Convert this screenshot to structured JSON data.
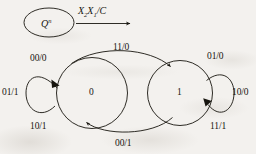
{
  "diagram": {
    "title_semantic": "mealy-state-transition-diagram",
    "legend": {
      "state_symbol_base": "Q",
      "state_symbol_exponent": "n",
      "arrow_label_x2": "X",
      "arrow_label_x2_sub": "2",
      "arrow_label_x1": "X",
      "arrow_label_x1_sub": "1",
      "arrow_label_tail": "/C",
      "icon_state_node": "ellipse-node-icon",
      "icon_transition_arrow": "right-arrow-icon"
    },
    "states": [
      {
        "id": "state-0",
        "label": "0"
      },
      {
        "id": "state-1",
        "label": "1"
      }
    ],
    "transitions": [
      {
        "id": "loop-0-top",
        "from": "0",
        "to": "0",
        "label": "00/0",
        "position": "above-left"
      },
      {
        "id": "loop-0-left",
        "from": "0",
        "to": "0",
        "label": "01/1",
        "position": "left"
      },
      {
        "id": "loop-0-bottom",
        "from": "0",
        "to": "0",
        "label": "10/1",
        "position": "below-left"
      },
      {
        "id": "arc-0-to-1",
        "from": "0",
        "to": "1",
        "label": "11/0",
        "position": "top-center"
      },
      {
        "id": "arc-1-to-0",
        "from": "1",
        "to": "0",
        "label": "00/1",
        "position": "bottom-center"
      },
      {
        "id": "loop-1-top",
        "from": "1",
        "to": "1",
        "label": "01/0",
        "position": "above-right"
      },
      {
        "id": "loop-1-right",
        "from": "1",
        "to": "1",
        "label": "10/0",
        "position": "right"
      },
      {
        "id": "loop-1-bottom",
        "from": "1",
        "to": "1",
        "label": "11/1",
        "position": "below-right"
      }
    ],
    "colors": {
      "ink": "#17150f",
      "paper": "#f3f1ee"
    }
  }
}
